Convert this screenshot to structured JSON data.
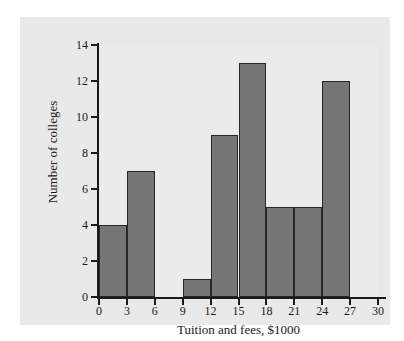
{
  "figure": {
    "background_color": "#e9e9e9",
    "plot_background_color": "#ebebeb",
    "page_color": "#ffffff",
    "axis_color": "#1a1a1a",
    "bar_fill_color": "#767676",
    "bar_edge_color": "#262626"
  },
  "chart_data": {
    "type": "bar",
    "chart_subtype": "histogram",
    "title": "",
    "xlabel": "Tuition and fees, $1000",
    "ylabel": "Number of colleges",
    "xlim": [
      0,
      30
    ],
    "ylim": [
      0,
      14
    ],
    "bin_width": 3,
    "grid": false,
    "legend": false,
    "legend_position": "none",
    "xticks": [
      0,
      3,
      6,
      9,
      12,
      15,
      18,
      21,
      24,
      27,
      30
    ],
    "xtick_labels": [
      "0",
      "3",
      "6",
      "9",
      "12",
      "15",
      "18",
      "21",
      "24",
      "27",
      "30"
    ],
    "yticks": [
      0,
      2,
      4,
      6,
      8,
      10,
      12,
      14
    ],
    "ytick_labels": [
      "0",
      "2",
      "4",
      "6",
      "8",
      "10",
      "12",
      "14"
    ],
    "categories": [
      "0-3",
      "3-6",
      "6-9",
      "9-12",
      "12-15",
      "15-18",
      "18-21",
      "21-24",
      "24-27",
      "27-30"
    ],
    "bin_edges": [
      0,
      3,
      6,
      9,
      12,
      15,
      18,
      21,
      24,
      27,
      30
    ],
    "values": [
      4,
      7,
      0,
      1,
      9,
      13,
      5,
      5,
      12,
      0
    ],
    "bins": [
      {
        "label": "0-3",
        "start": 0,
        "end": 3,
        "count": 4
      },
      {
        "label": "3-6",
        "start": 3,
        "end": 6,
        "count": 7
      },
      {
        "label": "6-9",
        "start": 6,
        "end": 9,
        "count": 0
      },
      {
        "label": "9-12",
        "start": 9,
        "end": 12,
        "count": 1
      },
      {
        "label": "12-15",
        "start": 12,
        "end": 15,
        "count": 9
      },
      {
        "label": "15-18",
        "start": 15,
        "end": 18,
        "count": 13
      },
      {
        "label": "18-21",
        "start": 18,
        "end": 21,
        "count": 5
      },
      {
        "label": "21-24",
        "start": 21,
        "end": 24,
        "count": 5
      },
      {
        "label": "24-27",
        "start": 24,
        "end": 27,
        "count": 12
      },
      {
        "label": "27-30",
        "start": 27,
        "end": 30,
        "count": 0
      }
    ]
  }
}
